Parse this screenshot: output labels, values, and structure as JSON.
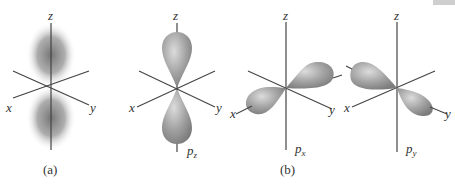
{
  "figure": {
    "panels": [
      {
        "id": "a",
        "caption": "(a)",
        "type": "electron-density-cloud",
        "axes": {
          "z": "z",
          "x": "x",
          "y": "y"
        }
      },
      {
        "id": "b",
        "caption": "(b)",
        "orbitals": [
          {
            "name": "pz",
            "base": "p",
            "subscript": "z",
            "axes": {
              "z": "z",
              "x": "x",
              "y": "y"
            }
          },
          {
            "name": "px",
            "base": "p",
            "subscript": "x",
            "axes": {
              "z": "z",
              "x": "x",
              "y": "y"
            }
          },
          {
            "name": "py",
            "base": "p",
            "subscript": "y",
            "axes": {
              "z": "z",
              "x": "x",
              "y": "y"
            }
          }
        ]
      }
    ],
    "colors": {
      "axis": "#444444",
      "lobe_fill": "#9a9a9a",
      "lobe_highlight": "#d6d6d6",
      "cloud": "#6e6e6e"
    }
  }
}
